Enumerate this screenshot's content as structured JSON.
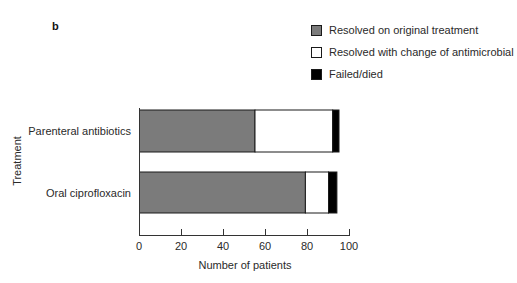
{
  "panel_label": "b",
  "legend": [
    {
      "label": "Resolved on original treatment",
      "color": "#7b7b7b"
    },
    {
      "label": "Resolved with change of antimicrobial",
      "color": "#ffffff"
    },
    {
      "label": "Failed/died",
      "color": "#000000"
    }
  ],
  "axes": {
    "y_title": "Treatment",
    "x_title": "Number of patients",
    "x_ticks": [
      "0",
      "20",
      "40",
      "60",
      "80",
      "100"
    ]
  },
  "categories": [
    "Parenteral antibiotics",
    "Oral ciprofloxacin"
  ],
  "chart_data": {
    "type": "bar",
    "orientation": "horizontal",
    "stacked": true,
    "title": "",
    "panel_label": "b",
    "xlabel": "Number of patients",
    "ylabel": "Treatment",
    "xlim": [
      0,
      100
    ],
    "x_ticks": [
      0,
      20,
      40,
      60,
      80,
      100
    ],
    "grid": false,
    "legend_position": "top-right",
    "categories": [
      "Parenteral antibiotics",
      "Oral ciprofloxacin"
    ],
    "series": [
      {
        "name": "Resolved on original treatment",
        "color": "#7b7b7b",
        "values": [
          55,
          79
        ]
      },
      {
        "name": "Resolved with change of antimicrobial",
        "color": "#ffffff",
        "values": [
          37,
          11
        ]
      },
      {
        "name": "Failed/died",
        "color": "#000000",
        "values": [
          3,
          4
        ]
      }
    ]
  }
}
